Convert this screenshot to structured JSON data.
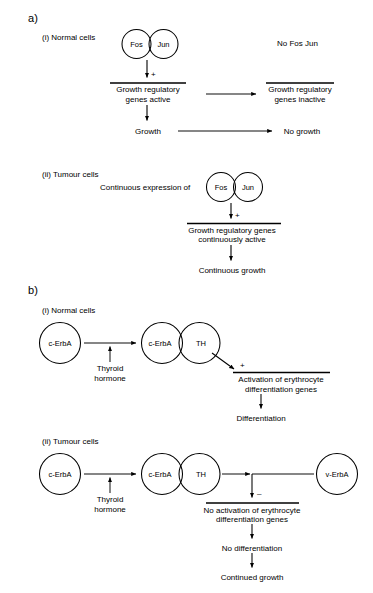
{
  "figure": {
    "panels": [
      {
        "label": "a)",
        "sections": [
          {
            "head": "(i) Normal cells",
            "nodes": [
              {
                "name": "fos",
                "label": "Fos"
              },
              {
                "name": "jun",
                "label": "Jun"
              }
            ],
            "signs": [
              {
                "name": "plus",
                "glyph": "+"
              }
            ],
            "texts": [
              {
                "name": "no-fos-jun",
                "value": "No Fos Jun"
              },
              {
                "name": "genes-active-line1",
                "value": "Growth regulatory"
              },
              {
                "name": "genes-active-line2",
                "value": "genes active"
              },
              {
                "name": "genes-inactive-line1",
                "value": "Growth regulatory"
              },
              {
                "name": "genes-inactive-line2",
                "value": "genes inactive"
              },
              {
                "name": "growth",
                "value": "Growth"
              },
              {
                "name": "no-growth",
                "value": "No growth"
              }
            ]
          },
          {
            "head": "(ii) Tumour cells",
            "nodes": [
              {
                "name": "fos",
                "label": "Fos"
              },
              {
                "name": "jun",
                "label": "Jun"
              }
            ],
            "signs": [
              {
                "name": "plus",
                "glyph": "+"
              }
            ],
            "texts": [
              {
                "name": "continuous-expression",
                "value": "Continuous expression of"
              },
              {
                "name": "genes-cont-active-line1",
                "value": "Growth regulatory genes"
              },
              {
                "name": "genes-cont-active-line2",
                "value": "continuously active"
              },
              {
                "name": "continuous-growth",
                "value": "Continuous growth"
              }
            ]
          }
        ]
      },
      {
        "label": "b)",
        "sections": [
          {
            "head": "(i) Normal cells",
            "nodes": [
              {
                "name": "c-erba-free",
                "label": "c-ErbA"
              },
              {
                "name": "c-erba-bound",
                "label": "c-ErbA"
              },
              {
                "name": "th",
                "label": "TH"
              }
            ],
            "signs": [
              {
                "name": "plus",
                "glyph": "+"
              }
            ],
            "texts": [
              {
                "name": "thyroid-hormone-line1",
                "value": "Thyroid"
              },
              {
                "name": "thyroid-hormone-line2",
                "value": "hormone"
              },
              {
                "name": "activation-line1",
                "value": "Activation of erythrocyte"
              },
              {
                "name": "activation-line2",
                "value": "differentiation genes"
              },
              {
                "name": "differentiation",
                "value": "Differentiation"
              }
            ]
          },
          {
            "head": "(ii) Tumour cells",
            "nodes": [
              {
                "name": "c-erba-free",
                "label": "c-ErbA"
              },
              {
                "name": "c-erba-bound",
                "label": "c-ErbA"
              },
              {
                "name": "th",
                "label": "TH"
              },
              {
                "name": "v-erba",
                "label": "v-ErbA"
              }
            ],
            "signs": [
              {
                "name": "minus",
                "glyph": "–"
              }
            ],
            "texts": [
              {
                "name": "thyroid-hormone-line1",
                "value": "Thyroid"
              },
              {
                "name": "thyroid-hormone-line2",
                "value": "hormone"
              },
              {
                "name": "no-activation-line1",
                "value": "No activation of erythrocyte"
              },
              {
                "name": "no-activation-line2",
                "value": "differentiation genes"
              },
              {
                "name": "no-differentiation",
                "value": "No differentiation"
              },
              {
                "name": "continued-growth",
                "value": "Continued growth"
              }
            ]
          }
        ]
      }
    ]
  },
  "style": {
    "ink": "#000000",
    "background": "#ffffff"
  }
}
